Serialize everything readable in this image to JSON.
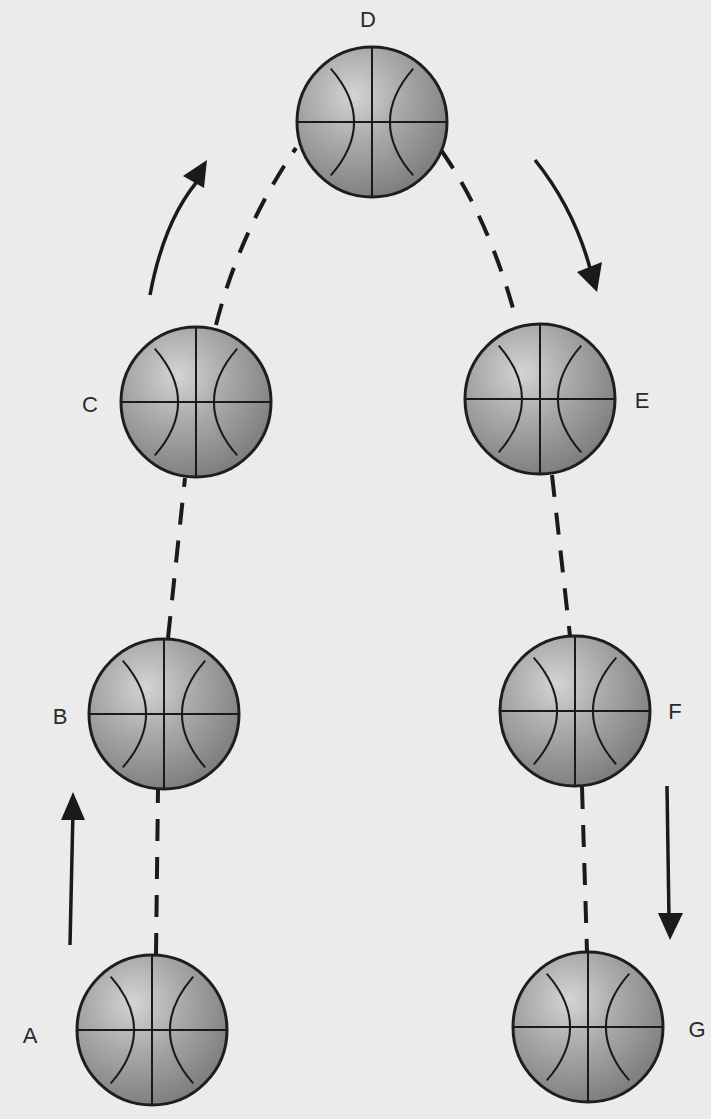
{
  "diagram": {
    "colors": {
      "background": "#ebebeb",
      "ball_highlight": "#d2d2d2",
      "ball_mid": "#a6a6a6",
      "ball_edge": "#7a7a7a",
      "line": "#1a1a1a",
      "label": "#2a2a2a"
    },
    "ball_radius": 75,
    "balls": [
      {
        "id": "A",
        "label": "A",
        "cx": 152,
        "cy": 1030,
        "label_x": 30,
        "label_y": 1036
      },
      {
        "id": "B",
        "label": "B",
        "cx": 164,
        "cy": 714,
        "label_x": 60,
        "label_y": 717
      },
      {
        "id": "C",
        "label": "C",
        "cx": 196,
        "cy": 402,
        "label_x": 90,
        "label_y": 405
      },
      {
        "id": "D",
        "label": "D",
        "cx": 372,
        "cy": 122,
        "label_x": 368,
        "label_y": 20
      },
      {
        "id": "E",
        "label": "E",
        "cx": 540,
        "cy": 399,
        "label_x": 642,
        "label_y": 401
      },
      {
        "id": "F",
        "label": "F",
        "cx": 575,
        "cy": 711,
        "label_x": 675,
        "label_y": 712
      },
      {
        "id": "G",
        "label": "G",
        "cx": 588,
        "cy": 1027,
        "label_x": 697,
        "label_y": 1030
      }
    ],
    "paths": [
      {
        "from": "A",
        "to": "B",
        "d": "M156,955 L158,790"
      },
      {
        "from": "B",
        "to": "C",
        "d": "M168,638 L185,478"
      },
      {
        "from": "C",
        "to": "D",
        "d": "M216,325 Q240,230 296,148"
      },
      {
        "from": "D",
        "to": "E",
        "d": "M441,150 Q490,220 517,323"
      },
      {
        "from": "E",
        "to": "F",
        "d": "M552,475 L570,636"
      },
      {
        "from": "F",
        "to": "G",
        "d": "M582,787 L587,952"
      }
    ],
    "arrows": [
      {
        "id": "up-left-straight",
        "direction": "up",
        "d": "M70,945 L73,810",
        "head": "73,792 61,820 85,820"
      },
      {
        "id": "up-left-curved",
        "direction": "up-right",
        "d": "M150,295 Q165,215 203,175",
        "head": "207,160 183,176 204,188"
      },
      {
        "id": "down-right-curved",
        "direction": "down-right",
        "d": "M535,160 Q575,210 591,272",
        "head": "597,292 602,262 577,272"
      },
      {
        "id": "down-right-straight",
        "direction": "down",
        "d": "M667,786 L669,920",
        "head": "670,940 658,913 683,913"
      }
    ]
  }
}
